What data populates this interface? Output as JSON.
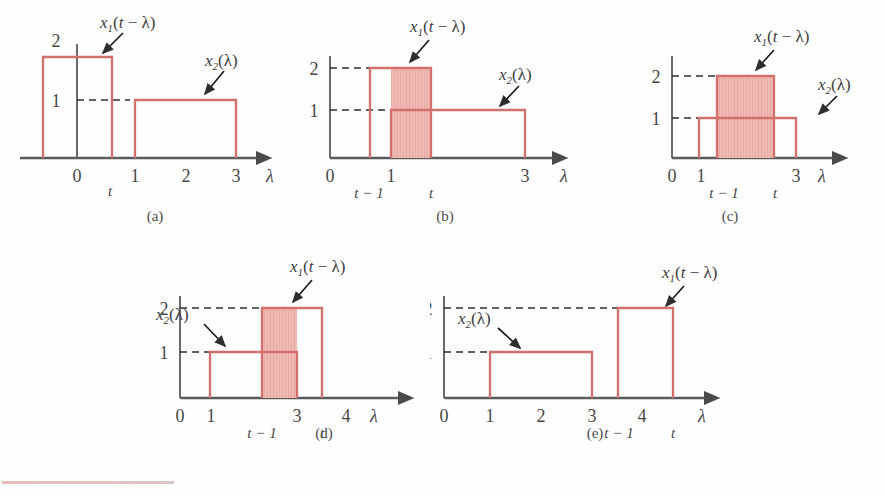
{
  "figure": {
    "type": "signal-convolution-graphical-illustration",
    "panel_count": 5,
    "axis_variable": "λ",
    "curve_color": "#d4706b",
    "shade_color": "#eeb3ad",
    "axis_color": "#5a5a5a",
    "dash_color": "#3a3a3a"
  },
  "labels": {
    "x1": "x",
    "x1_sub": "1",
    "x1_arg": "(t − λ)",
    "x2": "x",
    "x2_sub": "2",
    "x2_arg": "(λ)",
    "lambda": "λ",
    "t": "t",
    "t_minus_1": "t − 1",
    "zero": "0",
    "one": "1",
    "two": "2",
    "three": "3",
    "four": "4"
  },
  "panels": [
    {
      "id": "a",
      "caption": "(a)",
      "description": "x1 pulse straddles the origin, no overlap with x2",
      "ticks": [
        "0",
        "1",
        "2",
        "3"
      ],
      "under_ticks": [
        "t"
      ],
      "y_ticks": [
        "2",
        "1"
      ],
      "x1_label": "x₁(t − λ)",
      "x2_label": "x₂(λ)",
      "x1_height": 2,
      "x2_height": 1,
      "x1_range": [
        -0.6,
        0.4
      ],
      "x2_range": [
        1,
        3
      ],
      "shaded": false,
      "shade_range": null
    },
    {
      "id": "b",
      "caption": "(b)",
      "description": "partial overlap, x1 leading edge inside x2",
      "ticks": [
        "0",
        "1",
        "3"
      ],
      "under_ticks": [
        "t − 1",
        "t"
      ],
      "y_ticks": [
        "2",
        "1"
      ],
      "x1_label": "x₁(t − λ)",
      "x2_label": "x₂(λ)",
      "x1_height": 2,
      "x2_height": 1,
      "x1_range": [
        0.55,
        1.55
      ],
      "x2_range": [
        1,
        3
      ],
      "shaded": true,
      "shade_range": [
        1,
        1.55
      ]
    },
    {
      "id": "c",
      "caption": "(c)",
      "description": "x1 completely inside x2, full overlap",
      "ticks": [
        "0",
        "1",
        "3"
      ],
      "under_ticks": [
        "t − 1",
        "t"
      ],
      "y_ticks": [
        "2",
        "1"
      ],
      "x1_label": "x₁(t − λ)",
      "x2_label": "x₂(λ)",
      "x1_height": 2,
      "x2_height": 1,
      "x1_range": [
        1.45,
        2.55
      ],
      "x2_range": [
        1,
        3
      ],
      "shaded": true,
      "shade_range": [
        1.45,
        2.55
      ]
    },
    {
      "id": "d",
      "caption": "(d)",
      "description": "partial overlap, x1 trailing edge past end of x2",
      "ticks": [
        "0",
        "1",
        "3",
        "4"
      ],
      "under_ticks": [
        "t − 1",
        "t"
      ],
      "y_ticks": [
        "2",
        "1"
      ],
      "x1_label": "x₁(t − λ)",
      "x2_label": "x₂(λ)",
      "x1_height": 2,
      "x2_height": 1,
      "x1_range": [
        2.6,
        3.6
      ],
      "x2_range": [
        1,
        3
      ],
      "shaded": true,
      "shade_range": [
        2.6,
        3
      ]
    },
    {
      "id": "e",
      "caption": "(e)",
      "description": "no overlap, x1 entirely past x2",
      "ticks": [
        "0",
        "1",
        "2",
        "3",
        "4"
      ],
      "under_ticks": [
        "t − 1",
        "t"
      ],
      "y_ticks": [
        "2",
        "1"
      ],
      "x1_label": "x₁(t − λ)",
      "x2_label": "x₂(λ)",
      "x1_height": 2,
      "x2_height": 1,
      "x1_range": [
        3.4,
        4.45
      ],
      "x2_range": [
        1,
        3
      ],
      "shaded": false,
      "shade_range": null
    }
  ]
}
